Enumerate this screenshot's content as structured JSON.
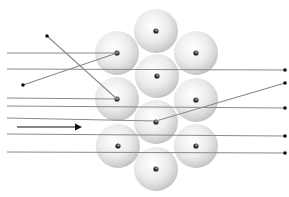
{
  "diagram": {
    "width": 289,
    "height": 197,
    "colors": {
      "background": "#ffffff",
      "ray": "#8a8a8a",
      "endpoint": "#111111",
      "arrow": "#111111",
      "atom_light": "#ffffff",
      "atom_mid": "#e6e6e6",
      "atom_dark": "#b9b9b9",
      "nucleus": "#222222"
    },
    "atom_radius": 22,
    "atoms": [
      {
        "id": "top",
        "cx": 156,
        "cy": 31
      },
      {
        "id": "upper-left",
        "cx": 117,
        "cy": 53
      },
      {
        "id": "upper-right",
        "cx": 196,
        "cy": 53
      },
      {
        "id": "center-upper",
        "cx": 157,
        "cy": 76
      },
      {
        "id": "middle-left",
        "cx": 117,
        "cy": 99
      },
      {
        "id": "middle-right",
        "cx": 196,
        "cy": 100
      },
      {
        "id": "center-lower",
        "cx": 156,
        "cy": 122
      },
      {
        "id": "lower-left",
        "cx": 118,
        "cy": 146
      },
      {
        "id": "lower-right",
        "cx": 196,
        "cy": 146
      },
      {
        "id": "bottom",
        "cx": 156,
        "cy": 169
      }
    ],
    "rays": [
      {
        "id": "ray-reflected-1",
        "points": [
          [
            7,
            53
          ],
          [
            117,
            53
          ],
          [
            23,
            85
          ]
        ],
        "end_dot": [
          23,
          85
        ]
      },
      {
        "id": "ray-straight-1",
        "points": [
          [
            7,
            69
          ],
          [
            285,
            70
          ]
        ],
        "end_dot": [
          285,
          70
        ]
      },
      {
        "id": "ray-reflected-2",
        "points": [
          [
            7,
            98
          ],
          [
            117,
            99
          ],
          [
            47,
            36
          ]
        ],
        "end_dot": [
          47,
          36
        ]
      },
      {
        "id": "ray-straight-2",
        "points": [
          [
            7,
            106
          ],
          [
            285,
            108
          ]
        ],
        "end_dot": [
          285,
          108
        ]
      },
      {
        "id": "ray-deflected",
        "points": [
          [
            7,
            118
          ],
          [
            156,
            121
          ],
          [
            285,
            83
          ]
        ],
        "end_dot": [
          285,
          83
        ]
      },
      {
        "id": "ray-straight-3",
        "points": [
          [
            7,
            134
          ],
          [
            285,
            136
          ]
        ],
        "end_dot": [
          285,
          136
        ]
      },
      {
        "id": "ray-straight-4",
        "points": [
          [
            7,
            152
          ],
          [
            285,
            153
          ]
        ],
        "end_dot": [
          285,
          153
        ]
      }
    ],
    "direction_arrow": {
      "x1": 17,
      "y1": 127,
      "x2": 82,
      "y2": 127
    }
  }
}
